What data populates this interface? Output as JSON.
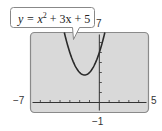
{
  "chart_data": {
    "type": "line",
    "title": "",
    "equation_label": "y = x² + 3x + 5",
    "equation": {
      "a": 1,
      "b": 3,
      "c": 5
    },
    "xlabel": "",
    "ylabel": "",
    "xlim": [
      -7,
      5
    ],
    "ylim": [
      -1,
      7
    ],
    "xscale_tick": 1,
    "yscale_tick": 1,
    "window_labels": {
      "xmin": "−7",
      "xmax": "5",
      "ymin": "−1",
      "ymax": "7"
    },
    "grid": false,
    "vertex": [
      -1.5,
      2.75
    ],
    "series": [
      {
        "name": "y = x^2 + 3x + 5",
        "x": [
          -3.56,
          -3.5,
          -3,
          -2.5,
          -2,
          -1.5,
          -1,
          -0.5,
          0,
          0.5,
          0.56
        ],
        "y": [
          7,
          6.75,
          5,
          3.75,
          3,
          2.75,
          3,
          3.75,
          5,
          6.75,
          7
        ]
      }
    ],
    "colors": {
      "screen": "#d9d9d9",
      "screen_border": "#8a8a8a",
      "curve": "#2a2a2a",
      "axis": "#333333"
    }
  },
  "callout": {
    "equation_prefix": "y = x",
    "exponent": "2",
    "equation_suffix": " + 3x + 5"
  }
}
